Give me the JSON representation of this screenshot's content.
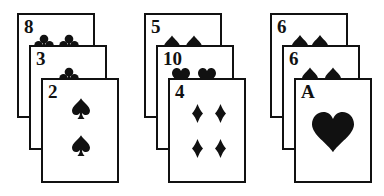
{
  "groups": [
    {
      "label": "group-1",
      "cards": [
        {
          "rank": "8",
          "suit": "clubs"
        },
        {
          "rank": "3",
          "suit": "clubs"
        },
        {
          "rank": "2",
          "suit": "spades"
        }
      ]
    },
    {
      "label": "group-2",
      "cards": [
        {
          "rank": "5",
          "suit": "spades"
        },
        {
          "rank": "10",
          "suit": "hearts"
        },
        {
          "rank": "4",
          "suit": "diamonds"
        }
      ]
    },
    {
      "label": "group-3",
      "cards": [
        {
          "rank": "6",
          "suit": "spades"
        },
        {
          "rank": "6",
          "suit": "spades"
        },
        {
          "rank": "A",
          "suit": "hearts"
        }
      ]
    }
  ],
  "colors": {
    "ink": "#111111",
    "card_face": "#ffffff",
    "background": "#ffffff"
  }
}
